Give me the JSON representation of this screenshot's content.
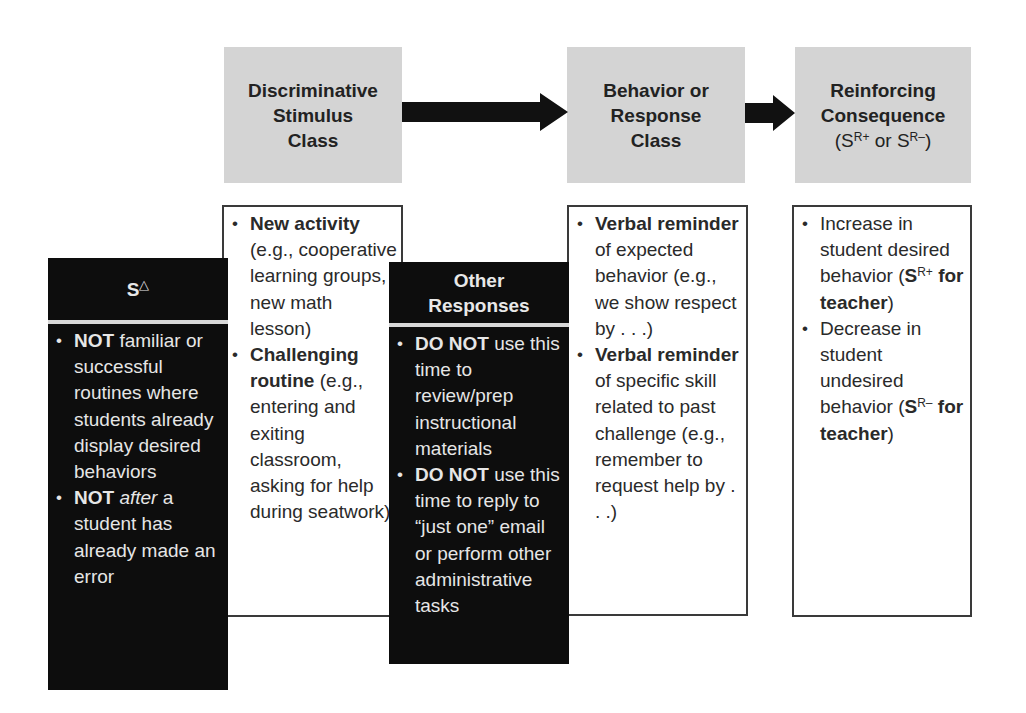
{
  "header_boxes": {
    "discriminative": {
      "line1": "Discriminative",
      "line2": "Stimulus",
      "line3": "Class"
    },
    "behavior": {
      "line1": "Behavior or",
      "line2": "Response",
      "line3": "Class"
    },
    "reinforcing": {
      "line1": "Reinforcing",
      "line2": "Consequence",
      "line3_open": "(S",
      "line3_sup1": "R+",
      "line3_mid": " or S",
      "line3_sup2": "R–",
      "line3_close": ")"
    }
  },
  "arrows": [
    {
      "from": "discriminative",
      "to": "behavior",
      "color": "#111111"
    },
    {
      "from": "behavior",
      "to": "reinforcing",
      "color": "#111111"
    }
  ],
  "s_delta_box": {
    "title": "S",
    "title_symbol": "△",
    "items": [
      {
        "bold": "NOT",
        "text": " familiar or successful routines where students already display desired behaviors"
      },
      {
        "bold": "NOT",
        "italic": " after",
        "text": " a student has already made an error"
      }
    ]
  },
  "discriminative_box": {
    "items": [
      {
        "bold": "New activity",
        "text": " (e.g., cooperative learning groups, new math lesson)"
      },
      {
        "bold": "Challenging routine",
        "text": " (e.g., entering and exiting classroom, asking for help during seatwork)"
      }
    ]
  },
  "other_responses_box": {
    "title_line1": "Other",
    "title_line2": "Responses",
    "items": [
      {
        "bold": "DO NOT",
        "text": " use this time to review/prep instructional materials"
      },
      {
        "bold": "DO NOT",
        "text": " use this time to reply to “just one” email or perform other administrative tasks"
      }
    ]
  },
  "behavior_box": {
    "items": [
      {
        "bold": "Verbal reminder",
        "text": " of expected behavior (e.g., we show respect by . . .)"
      },
      {
        "bold": "Verbal reminder",
        "text": " of specific skill related to past challenge (e.g., remember to request help by . . .)"
      }
    ]
  },
  "reinforcing_box": {
    "items": [
      {
        "text": "Increase in student desired behavior (",
        "bold": "S",
        "sup": "R+",
        "bold2": " for teacher",
        "close": ")"
      },
      {
        "text": "Decrease in student undesired behavior (",
        "bold": "S",
        "sup": "R–",
        "bold2": " for teacher",
        "close": ")"
      }
    ]
  },
  "colors": {
    "header_fill": "#d4d4d4",
    "black_box_fill": "#0d0d0d",
    "black_box_text": "#e6e6e6",
    "white_box_border": "#3a3a3a"
  }
}
